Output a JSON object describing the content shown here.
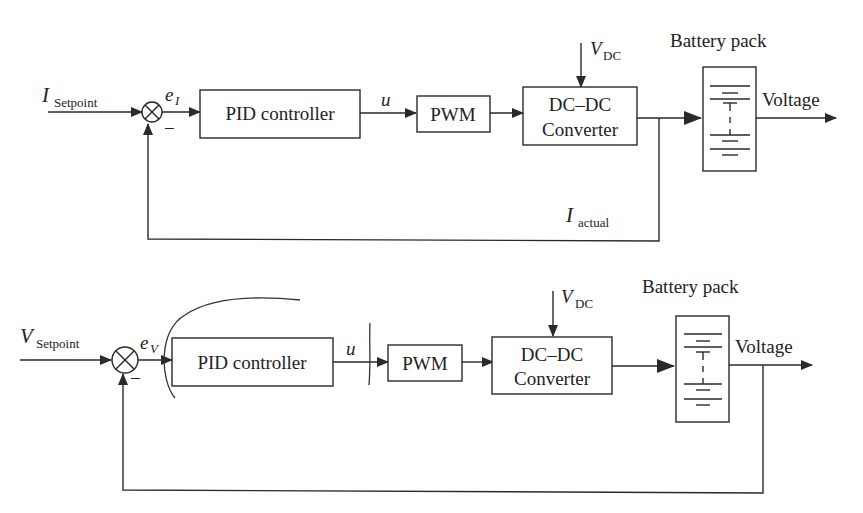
{
  "diagrams": [
    {
      "id": "current-loop",
      "input": {
        "symbol": "I",
        "subscript": "Setpoint"
      },
      "error": {
        "symbol": "e",
        "subscript": "I"
      },
      "summing_sign": "−",
      "controller": "PID controller",
      "control_signal": "u",
      "modulator": "PWM",
      "converter": {
        "line1": "DC–DC",
        "line2": "Converter"
      },
      "supply": {
        "symbol": "V",
        "subscript": "DC"
      },
      "plant": "Battery pack",
      "output": "Voltage",
      "feedback": {
        "symbol": "I",
        "subscript": "actual"
      }
    },
    {
      "id": "voltage-loop",
      "input": {
        "symbol": "V",
        "subscript": "Setpoint"
      },
      "error": {
        "symbol": "e",
        "subscript": "V"
      },
      "summing_sign": "−",
      "controller": "PID controller",
      "control_signal": "u",
      "modulator": "PWM",
      "converter": {
        "line1": "DC–DC",
        "line2": "Converter"
      },
      "supply": {
        "symbol": "V",
        "subscript": "DC"
      },
      "plant": "Battery pack",
      "output": "Voltage"
    }
  ],
  "colors": {
    "line": "#2a2a2a",
    "background": "#ffffff"
  }
}
